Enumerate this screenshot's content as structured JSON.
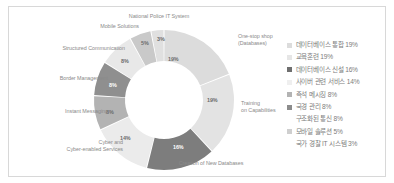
{
  "chart_data": {
    "type": "pie",
    "title": "",
    "subtitle": "",
    "xlabel": "",
    "ylabel": "",
    "donut": true,
    "grid": false,
    "legend_position": "right",
    "categories": [
      "One-stop shop (Databases)",
      "Training on Capabilities",
      "Creation of New Databases",
      "Cyber and Cyber-enabled Services",
      "Instant Messaging",
      "Border Management",
      "Structured Communication",
      "Mobile Solutions",
      "National Police IT System"
    ],
    "values": [
      19,
      19,
      16,
      14,
      8,
      8,
      8,
      5,
      3
    ],
    "value_labels": [
      "19%",
      "19%",
      "16%",
      "14%",
      "8%",
      "8%",
      "8%",
      "5%",
      "3%"
    ],
    "colors": [
      "#dcdcdc",
      "#e3e3e3",
      "#7d7d7d",
      "#ebebeb",
      "#b3b3b3",
      "#8f8f8f",
      "#e8e8e8",
      "#c9c9c9",
      "#e0e0e0"
    ]
  },
  "slice_labels": {
    "one_stop_shop": "One-stop shop\n(Databases)",
    "one_stop_shop_l1": "One-stop shop",
    "one_stop_shop_l2": "(Databases)",
    "training_l1": "Training",
    "training_l2": "on Capabilities",
    "creation": "Creation of New Databases",
    "cyber_l1": "Cyber and",
    "cyber_l2": "Cyber-enabled Services",
    "instant_messaging": "Instant Messaging",
    "border_management": "Border Management",
    "structured_communication": "Structured Communication",
    "mobile_solutions": "Mobile Solutions",
    "national_police": "National Police IT System"
  },
  "slice_percent": {
    "one_stop_shop": "19%",
    "training": "19%",
    "creation": "16%",
    "cyber": "14%",
    "instant_messaging": "8%",
    "border_management": "8%",
    "structured_communication": "8%",
    "mobile_solutions": "5%",
    "national_police": "3%"
  },
  "legend": {
    "items": [
      {
        "label": "데이터베이스 통합 19%",
        "color": "#dcdcdc",
        "swatch_visible": true
      },
      {
        "label": "교육훈련 19%",
        "color": "#e6e6e6",
        "swatch_visible": true
      },
      {
        "label": "데이터베이스 신설 16%",
        "color": "#6f6f6f",
        "swatch_visible": true
      },
      {
        "label": "사이버 관련 서비스 14%",
        "color": "#efefef",
        "swatch_visible": true
      },
      {
        "label": "즉석 메시징 8%",
        "color": "#b3b3b3",
        "swatch_visible": true
      },
      {
        "label": "국경 관리 8%",
        "color": "#8c8c8c",
        "swatch_visible": true
      },
      {
        "label": "구조화된 통신 8%",
        "color": "#f2f2f2",
        "swatch_visible": false
      },
      {
        "label": "모바일 솔루션 5%",
        "color": "#cfcfcf",
        "swatch_visible": true
      },
      {
        "label": "국가 경찰 IT 시스템 3%",
        "color": "#e6e6e6",
        "swatch_visible": false
      }
    ]
  }
}
